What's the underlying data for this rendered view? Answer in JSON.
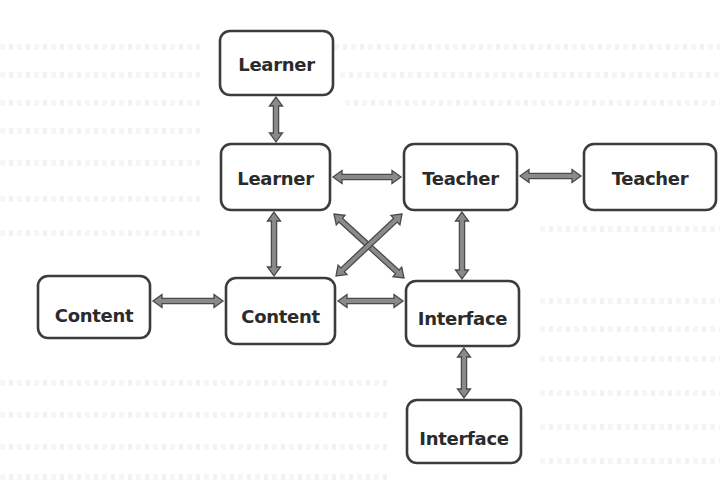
{
  "diagram": {
    "type": "interaction-network",
    "colors": {
      "box_border": "#3c3c3c",
      "box_fill": "#ffffff",
      "label": "#2b2b2b",
      "arrow_fill": "#8a8a8a",
      "arrow_outline": "#4a4a4a",
      "background": "#ffffff"
    },
    "nodes": [
      {
        "id": "learner-top",
        "label": "Learner"
      },
      {
        "id": "learner-center",
        "label": "Learner"
      },
      {
        "id": "teacher-center",
        "label": "Teacher"
      },
      {
        "id": "teacher-right",
        "label": "Teacher"
      },
      {
        "id": "content-left",
        "label": "Content"
      },
      {
        "id": "content-center",
        "label": "Content"
      },
      {
        "id": "interface-center",
        "label": "Interface"
      },
      {
        "id": "interface-bottom",
        "label": "Interface"
      }
    ],
    "edges": [
      {
        "from": "learner-top",
        "to": "learner-center",
        "direction": "both"
      },
      {
        "from": "learner-center",
        "to": "teacher-center",
        "direction": "both"
      },
      {
        "from": "teacher-center",
        "to": "teacher-right",
        "direction": "both"
      },
      {
        "from": "learner-center",
        "to": "content-center",
        "direction": "both"
      },
      {
        "from": "teacher-center",
        "to": "interface-center",
        "direction": "both"
      },
      {
        "from": "content-left",
        "to": "content-center",
        "direction": "both"
      },
      {
        "from": "content-center",
        "to": "interface-center",
        "direction": "both"
      },
      {
        "from": "interface-center",
        "to": "interface-bottom",
        "direction": "both"
      },
      {
        "from": "learner-center",
        "to": "interface-center",
        "direction": "both"
      },
      {
        "from": "teacher-center",
        "to": "content-center",
        "direction": "both"
      }
    ]
  }
}
